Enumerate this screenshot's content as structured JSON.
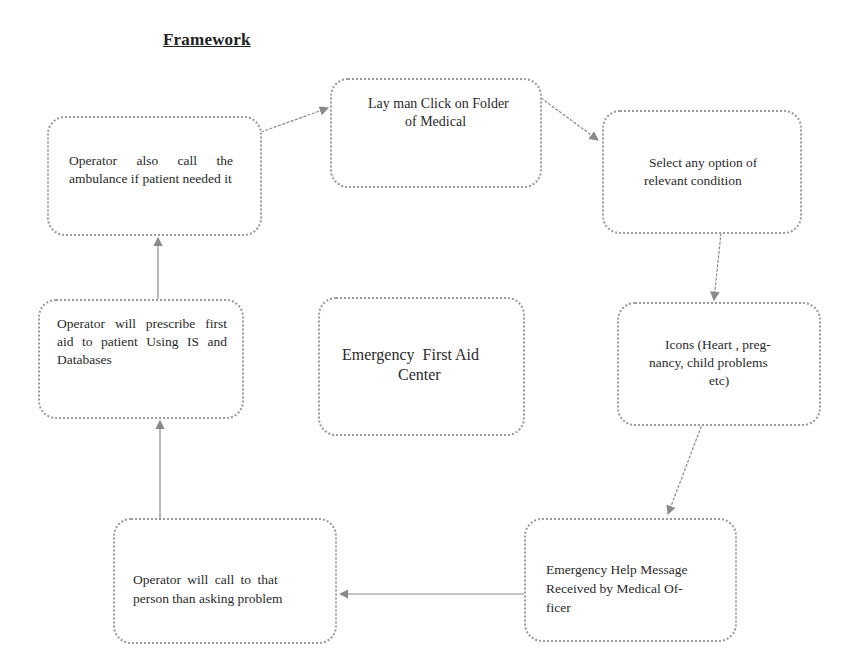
{
  "title": "Framework",
  "nodes": {
    "layman": "Lay man Click on Folder of Medical",
    "select": "Select any option of relevant condition",
    "icons": "Icons (Heart , preg-nancy, child problems etc)",
    "help_message": "Emergency Help Message Received by Medical Of-ficer",
    "operator_call": "Operator will call to that person than asking problem",
    "operator_prescribe": "Operator will prescribe first aid to patient Using IS and Databases",
    "operator_ambulance": "Operator also call the ambulance if patient needed it",
    "center": "Emergency First Aid Center"
  },
  "lines": {
    "layman_1": "Lay man Click on Folder",
    "layman_2": "of Medical",
    "select_1": "Select any option of",
    "select_2": "relevant condition",
    "icons_1": "Icons (Heart , preg-",
    "icons_2": "nancy, child problems",
    "icons_3": "etc)",
    "help_1": "Emergency Help Message",
    "help_2": "Received by Medical Of-",
    "help_3": "ficer",
    "call_1": "Operator will call to that",
    "call_2": "person than asking problem",
    "prescribe": "Operator will prescribe first aid to patient Using IS and Databases",
    "ambulance": "Operator also call the ambulance if patient needed it",
    "center_1": "Emergency  First Aid",
    "center_2": "Center"
  },
  "flow": [
    "Lay man Click on Folder of Medical",
    "Select any option of relevant condition",
    "Icons (Heart , preg-nancy, child problems etc)",
    "Emergency Help Message Received by Medical Of-ficer",
    "Operator will call to that person than asking problem",
    "Operator will prescribe first aid to patient Using IS and Databases",
    "Operator also call the ambulance if patient needed it",
    "Lay man Click on Folder of Medical"
  ],
  "colors": {
    "border": "#9a9a9a",
    "arrow": "#8a8a8a",
    "text": "#2a2a2a"
  }
}
